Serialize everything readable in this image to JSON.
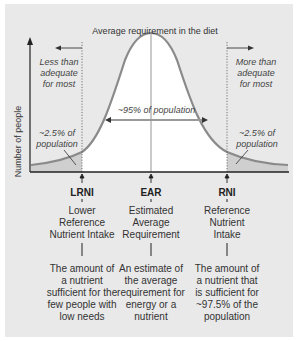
{
  "title": "Average requirement in the diet",
  "y_axis_label": "Number of people",
  "left_region": {
    "label": "Less than adequate for most",
    "lines": [
      "Less than",
      "adequate",
      "for most"
    ]
  },
  "right_region": {
    "label": "More than adequate for most",
    "lines": [
      "More than",
      "adequate",
      "for most"
    ]
  },
  "center_label": "~95% of population",
  "left_tail": {
    "lines": [
      "~2.5% of",
      "population"
    ]
  },
  "right_tail": {
    "lines": [
      "~2.5% of",
      "population"
    ]
  },
  "markers": [
    {
      "abbr": "LRNI",
      "name_lines": [
        "Lower",
        "Reference",
        "Nutrient Intake"
      ],
      "desc_lines": [
        "The amount of",
        "a nutrient",
        "sufficient for the",
        "few people with",
        "low needs"
      ]
    },
    {
      "abbr": "EAR",
      "name_lines": [
        "Estimated",
        "Average",
        "Requirement"
      ],
      "desc_lines": [
        "An estimate of",
        "the average",
        "requirement for",
        "energy or a",
        "nutrient"
      ]
    },
    {
      "abbr": "RNI",
      "name_lines": [
        "Reference",
        "Nutrient",
        "Intake"
      ],
      "desc_lines": [
        "The amount of",
        "a nutrient that",
        "is sufficient for",
        "~97.5% of the",
        "population"
      ]
    }
  ],
  "colors": {
    "panel": "#e9e9e9",
    "curve": "#8a8a8a",
    "tail_fill": "#cfcfcf",
    "axis": "#222222"
  }
}
